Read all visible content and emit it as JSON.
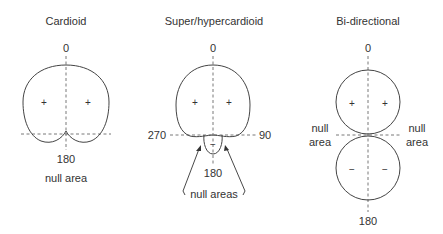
{
  "diagrams": [
    {
      "title": "Cardioid",
      "top_label": "0",
      "bottom_label": "180",
      "null_label": "null area",
      "lobe_signs": [
        "+",
        "+"
      ]
    },
    {
      "title": "Super/hypercardioid",
      "top_label": "0",
      "bottom_label": "180",
      "left_label": "270",
      "right_label": "90",
      "null_label": "null areas",
      "front_lobe_signs": [
        "+",
        "+"
      ],
      "rear_lobe_sign": "−"
    },
    {
      "title": "Bi-directional",
      "top_label": "0",
      "bottom_label": "180",
      "null_left_line1": "null",
      "null_left_line2": "area",
      "null_right_line1": "null",
      "null_right_line2": "area",
      "front_lobe_signs": [
        "+",
        "+"
      ],
      "rear_lobe_signs": [
        "−",
        "−"
      ]
    }
  ],
  "colors": {
    "line": "#444444",
    "text": "#333333",
    "background": "#ffffff"
  }
}
